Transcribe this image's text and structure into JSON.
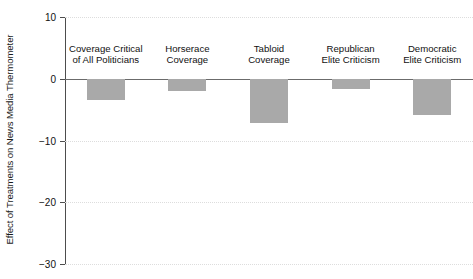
{
  "chart_data": {
    "type": "bar",
    "title": "",
    "subtitle": "",
    "xlabel": "",
    "ylabel": "Effect of Treatments on News Media Thermometer",
    "categories": [
      "Coverage Critical of All Politicians",
      "Horserace Coverage",
      "Tabloid Coverage",
      "Republican Elite Criticism",
      "Democratic Elite Criticism"
    ],
    "category_lines": [
      [
        "Coverage Critical",
        "of All Politicians"
      ],
      [
        "Horserace",
        "Coverage"
      ],
      [
        "Tabloid",
        "Coverage"
      ],
      [
        "Republican",
        "Elite Criticism"
      ],
      [
        "Democratic",
        "Elite Criticism"
      ]
    ],
    "values": [
      -3.5,
      -2.0,
      -7.1,
      -1.7,
      -5.8
    ],
    "ylim": [
      -30,
      10
    ],
    "yticks": [
      10,
      0,
      -10,
      -20,
      -30
    ],
    "ytick_labels": [
      "10",
      "0",
      "−10",
      "−20",
      "−30"
    ],
    "grid": true,
    "grid_axis": "y",
    "legend": "none",
    "bar_color": "#a9a9a9",
    "zero_line_color": "#6b6b6b",
    "grid_color": "#dddddd",
    "axis_color": "#4d4d4d"
  }
}
